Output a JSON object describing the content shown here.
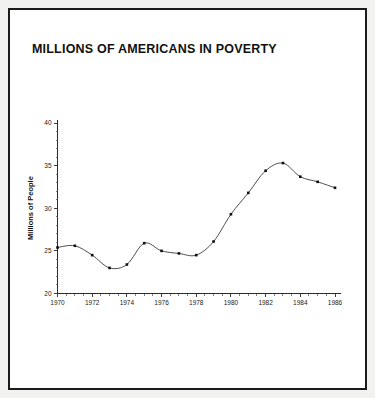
{
  "figure": {
    "title": "MILLIONS OF AMERICANS IN POVERTY",
    "frame_color": "#1b1b1b",
    "background_color": "#ffffff",
    "outer_background_color": "#f2f2f0",
    "line_color": "#3a3a3a",
    "marker_color": "#101010"
  },
  "chart_data": {
    "type": "line",
    "title": "MILLIONS OF AMERICANS IN POVERTY",
    "xlabel": "",
    "ylabel": "Millions of People",
    "x": [
      1970,
      1971,
      1972,
      1973,
      1974,
      1975,
      1976,
      1977,
      1978,
      1979,
      1980,
      1981,
      1982,
      1983,
      1984,
      1985,
      1986
    ],
    "values": [
      25.4,
      25.6,
      24.5,
      23.0,
      23.4,
      25.9,
      25.0,
      24.7,
      24.5,
      26.1,
      29.3,
      31.8,
      34.4,
      35.3,
      33.7,
      33.1,
      32.4
    ],
    "series": [
      {
        "name": "Americans in poverty",
        "values": [
          25.4,
          25.6,
          24.5,
          23.0,
          23.4,
          25.9,
          25.0,
          24.7,
          24.5,
          26.1,
          29.3,
          31.8,
          34.4,
          35.3,
          33.7,
          33.1,
          32.4
        ]
      }
    ],
    "xlim": [
      1970,
      1986
    ],
    "ylim": [
      20,
      40
    ],
    "xticks": [
      1970,
      1972,
      1974,
      1976,
      1978,
      1980,
      1982,
      1984,
      1986
    ],
    "xtick_labels": [
      "1970",
      "1972",
      "1974",
      "1976",
      "1978",
      "1980",
      "1982",
      "1984",
      "1986"
    ],
    "yticks": [
      20,
      25,
      30,
      35,
      40
    ],
    "ytick_labels": [
      "20",
      "25",
      "30",
      "35",
      "40"
    ],
    "grid": false,
    "legend": null,
    "markers": "square"
  }
}
